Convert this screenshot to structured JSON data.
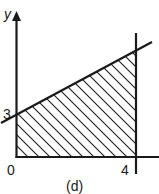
{
  "figure": {
    "caption": "(d)",
    "axes": {
      "y_label": "y",
      "x_label": ""
    },
    "ticks": {
      "origin": "0",
      "x_tick": "4",
      "y_tick": "3"
    },
    "colors": {
      "ink": "#1a1a1a",
      "background": "#ffffff"
    },
    "region": {
      "description": "Hatched region bounded by x=0, y=0, x=4, and the line through (0,3)",
      "vertices": [
        [
          0,
          0
        ],
        [
          0,
          3
        ],
        [
          4,
          5.3
        ],
        [
          4,
          0
        ]
      ],
      "fill": "diagonal-hatch"
    },
    "lines": [
      {
        "name": "vertical-line-x4",
        "equation": "x = 4"
      },
      {
        "name": "slanted-line",
        "passes_through": [
          0,
          3
        ]
      }
    ]
  }
}
